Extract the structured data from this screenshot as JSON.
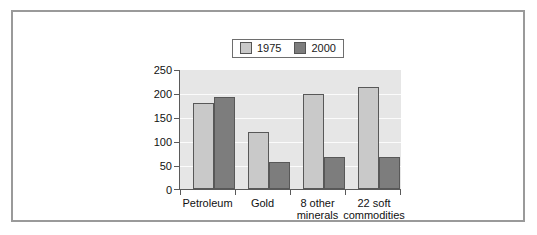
{
  "chart_data": {
    "type": "bar",
    "title": "",
    "subtitle": "",
    "xlabel": "",
    "ylabel": "",
    "ylim": [
      0,
      250
    ],
    "yticks": [
      0,
      50,
      100,
      150,
      200,
      250
    ],
    "grid": true,
    "legend_position": "top-center",
    "categories": [
      "Petroleum",
      "Gold",
      "8 other minerals",
      "22 soft commodities"
    ],
    "category_lines": [
      [
        "Petroleum",
        ""
      ],
      [
        "Gold",
        ""
      ],
      [
        "8 other",
        "minerals"
      ],
      [
        "22 soft",
        "commodities"
      ]
    ],
    "series": [
      {
        "name": "1975",
        "color": "#c9c9c9",
        "values": [
          180,
          120,
          199,
          215
        ]
      },
      {
        "name": "2000",
        "color": "#7d7d7d",
        "values": [
          193,
          57,
          68,
          67
        ]
      }
    ]
  },
  "legend": {
    "entries": [
      {
        "label": "1975",
        "swatch": "legend-swatch-1975"
      },
      {
        "label": "2000",
        "swatch": "legend-swatch-2000"
      }
    ]
  },
  "colors": {
    "series_1975": "#c9c9c9",
    "series_2000": "#7d7d7d",
    "plot_background": "#e6e6e6",
    "gridline": "#fbfbfb",
    "axis": "#5a5a5a",
    "frame_border": "#9a9a9a",
    "page_background": "#ffffff",
    "text": "#111111"
  },
  "axis": {
    "y_tick_labels": [
      "250",
      "200",
      "150",
      "100",
      "50",
      "0"
    ]
  }
}
